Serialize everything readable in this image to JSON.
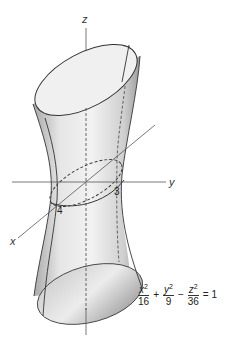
{
  "figure": {
    "axes": {
      "x_label": "x",
      "y_label": "y",
      "z_label": "z"
    },
    "intercepts": {
      "x": "4",
      "y": "3"
    },
    "equation": {
      "terms": [
        {
          "num_var": "x",
          "num_exp": "2",
          "den": "16"
        },
        {
          "num_var": "y",
          "num_exp": "2",
          "den": "9"
        },
        {
          "num_var": "z",
          "num_exp": "2",
          "den": "36"
        }
      ],
      "op1": "+",
      "op2": "−",
      "rhs": "= 1"
    },
    "colors": {
      "surface_light": "#f4f4f4",
      "surface_dark": "#9a9a9a",
      "line": "#333333"
    }
  }
}
